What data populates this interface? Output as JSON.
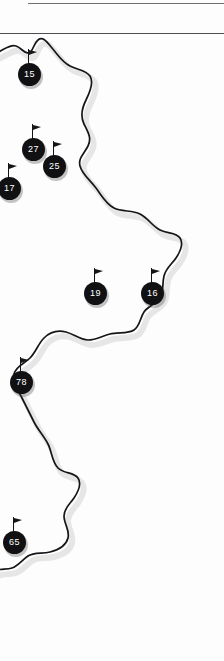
{
  "page": {
    "kind": "map-fragment",
    "width": 224,
    "height": 661,
    "background_color": "#fdfdfd"
  },
  "header": {
    "rules": [
      {
        "name": "top-rule",
        "color": "#6e6e72"
      },
      {
        "name": "second-rule",
        "color": "#4e4e52"
      }
    ]
  },
  "map": {
    "coastline_color": "#16161a",
    "shadow_color": "#c9c9c9",
    "land_fill": "#ffffff",
    "markers": [
      {
        "id": "marker-15",
        "label": "15",
        "x": 31,
        "y": 49,
        "name": "flag-marker-15"
      },
      {
        "id": "marker-27",
        "label": "27",
        "x": 35,
        "y": 124,
        "name": "flag-marker-27"
      },
      {
        "id": "marker-25",
        "label": "25",
        "x": 56,
        "y": 141,
        "name": "flag-marker-25"
      },
      {
        "id": "marker-17",
        "label": "17",
        "x": 11,
        "y": 163,
        "name": "flag-marker-17"
      },
      {
        "id": "marker-19",
        "label": "19",
        "x": 97,
        "y": 268,
        "name": "flag-marker-19"
      },
      {
        "id": "marker-16",
        "label": "16",
        "x": 154,
        "y": 268,
        "name": "flag-marker-16"
      },
      {
        "id": "marker-78",
        "label": "78",
        "x": 23,
        "y": 357,
        "name": "flag-marker-78"
      },
      {
        "id": "marker-65",
        "label": "65",
        "x": 16,
        "y": 517,
        "name": "flag-marker-65"
      }
    ]
  }
}
